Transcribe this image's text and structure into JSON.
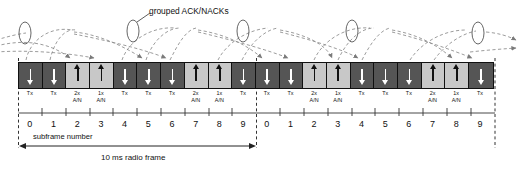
{
  "diagram": {
    "annotation_grouped": "grouped ACK/NACKs",
    "subframe_axis_label": "subframe number",
    "radio_frame_label": "10 ms radio frame"
  },
  "colors": {
    "downlink_block": "#555555",
    "uplink_block": "#c8c8c8",
    "outline": "#111111",
    "dashed_curve": "#808080",
    "background": "#ffffff"
  },
  "legend_semantics": {
    "downlink": "dark block, white down arrow, Tx",
    "uplink": "light block, black up arrow, A/N"
  },
  "blocks": [
    {
      "type": "dl",
      "line1": "Tx",
      "line2": "",
      "arrow": "down",
      "subframe": "0"
    },
    {
      "type": "dl",
      "line1": "Tx",
      "line2": "",
      "arrow": "down",
      "subframe": "1"
    },
    {
      "type": "ul",
      "line1": "2x",
      "line2": "A/N",
      "arrow": "up",
      "subframe": "2"
    },
    {
      "type": "ul",
      "line1": "1x",
      "line2": "A/N",
      "arrow": "up",
      "subframe": "3"
    },
    {
      "type": "dl",
      "line1": "Tx",
      "line2": "",
      "arrow": "down",
      "subframe": "4"
    },
    {
      "type": "dl",
      "line1": "Tx",
      "line2": "",
      "arrow": "down",
      "subframe": "5"
    },
    {
      "type": "dl",
      "line1": "Tx",
      "line2": "",
      "arrow": "down",
      "subframe": "6"
    },
    {
      "type": "ul",
      "line1": "2x",
      "line2": "A/N",
      "arrow": "up",
      "subframe": "7"
    },
    {
      "type": "ul",
      "line1": "1x",
      "line2": "A/N",
      "arrow": "up",
      "subframe": "8"
    },
    {
      "type": "dl",
      "line1": "Tx",
      "line2": "",
      "arrow": "down",
      "subframe": "9"
    },
    {
      "type": "dl",
      "line1": "Tx",
      "line2": "",
      "arrow": "down",
      "subframe": "0"
    },
    {
      "type": "dl",
      "line1": "Tx",
      "line2": "",
      "arrow": "down",
      "subframe": "1"
    },
    {
      "type": "ul",
      "line1": "2x",
      "line2": "A/N",
      "arrow": "up",
      "subframe": "2"
    },
    {
      "type": "ul",
      "line1": "1x",
      "line2": "A/N",
      "arrow": "up",
      "subframe": "3"
    },
    {
      "type": "dl",
      "line1": "Tx",
      "line2": "",
      "arrow": "down",
      "subframe": "4"
    },
    {
      "type": "dl",
      "line1": "Tx",
      "line2": "",
      "arrow": "down",
      "subframe": "5"
    },
    {
      "type": "dl",
      "line1": "Tx",
      "line2": "",
      "arrow": "down",
      "subframe": "6"
    },
    {
      "type": "ul",
      "line1": "2x",
      "line2": "A/N",
      "arrow": "up",
      "subframe": "7"
    },
    {
      "type": "ul",
      "line1": "1x",
      "line2": "A/N",
      "arrow": "up",
      "subframe": "8"
    },
    {
      "type": "dl",
      "line1": "Tx",
      "line2": "",
      "arrow": "down",
      "subframe": "9"
    }
  ]
}
